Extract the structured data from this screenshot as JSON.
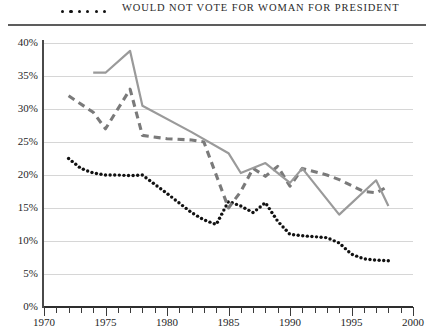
{
  "legend": {
    "marker_icon": "dotted-line-marker",
    "label": "WOULD NOT VOTE FOR WOMAN FOR PRESIDENT"
  },
  "axes": {
    "y_ticks": [
      "0%",
      "5%",
      "10%",
      "15%",
      "20%",
      "25%",
      "30%",
      "35%",
      "40%"
    ],
    "x_ticks": [
      "1970",
      "1975",
      "1980",
      "1985",
      "1990",
      "1995",
      "2000"
    ]
  },
  "chart_data": {
    "type": "line",
    "title": "",
    "subtitle": "",
    "xlabel": "",
    "ylabel": "",
    "xlim": [
      1970,
      2000
    ],
    "ylim": [
      0,
      40
    ],
    "y_unit": "%",
    "grid": true,
    "legend_position": "top",
    "x_tick_interval": 1,
    "x_label_interval": 5,
    "y_tick_interval": 5,
    "series": [
      {
        "name": "would not vote for woman for president",
        "style": "dotted",
        "color": "#111111",
        "x": [
          1972,
          1973,
          1974,
          1975,
          1976,
          1977,
          1978,
          1980,
          1982,
          1983,
          1984,
          1985,
          1986,
          1987,
          1988,
          1989,
          1990,
          1991,
          1993,
          1994,
          1995,
          1996,
          1997,
          1998
        ],
        "values": [
          22.5,
          21.0,
          20.3,
          20.0,
          20.0,
          19.9,
          20.0,
          17.2,
          14.3,
          13.2,
          12.5,
          16.0,
          15.3,
          14.3,
          15.8,
          13.0,
          11.0,
          10.8,
          10.5,
          9.7,
          8.0,
          7.3,
          7.1,
          7.0
        ]
      },
      {
        "name": "dashed gray series",
        "style": "dashed",
        "color": "#7a7a7a",
        "x": [
          1972,
          1974,
          1975,
          1977,
          1978,
          1980,
          1982,
          1983,
          1985,
          1986,
          1987,
          1988,
          1989,
          1990,
          1991,
          1993,
          1994,
          1996,
          1997,
          1998
        ],
        "values": [
          32.0,
          29.5,
          27.0,
          33.0,
          26.0,
          25.5,
          25.3,
          25.0,
          15.0,
          17.5,
          21.0,
          19.8,
          21.3,
          18.3,
          21.0,
          20.0,
          19.3,
          17.5,
          17.3,
          18.3
        ]
      },
      {
        "name": "solid gray series",
        "style": "solid",
        "color": "#9a9a9a",
        "x": [
          1974,
          1975,
          1977,
          1978,
          1982,
          1985,
          1986,
          1988,
          1990,
          1991,
          1994,
          1997,
          1998
        ],
        "values": [
          35.5,
          35.5,
          38.8,
          30.5,
          26.5,
          23.3,
          20.3,
          21.8,
          18.8,
          21.0,
          14.0,
          19.2,
          15.3
        ]
      }
    ]
  }
}
